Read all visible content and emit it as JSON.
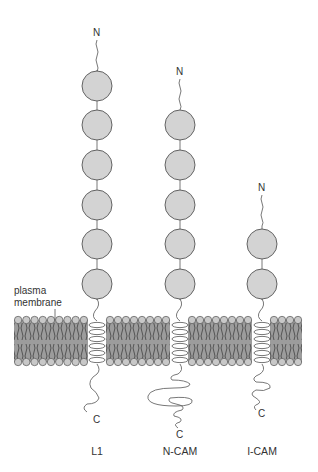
{
  "membrane_label": [
    "plasma",
    "membrane"
  ],
  "proteins": [
    {
      "name": "L1",
      "x": 97,
      "n_label": "N",
      "c_label": "C",
      "domains": 6
    },
    {
      "name": "N-CAM",
      "x": 180,
      "n_label": "N",
      "c_label": "C",
      "domains": 5
    },
    {
      "name": "I-CAM",
      "x": 262,
      "n_label": "N",
      "c_label": "C",
      "domains": 2
    }
  ],
  "colors": {
    "domain_fill": "#d3d3d3",
    "domain_stroke": "#555555",
    "bilayer_fill": "#9c9c9c",
    "head_fill": "#c8c8c8",
    "line": "#555555"
  }
}
